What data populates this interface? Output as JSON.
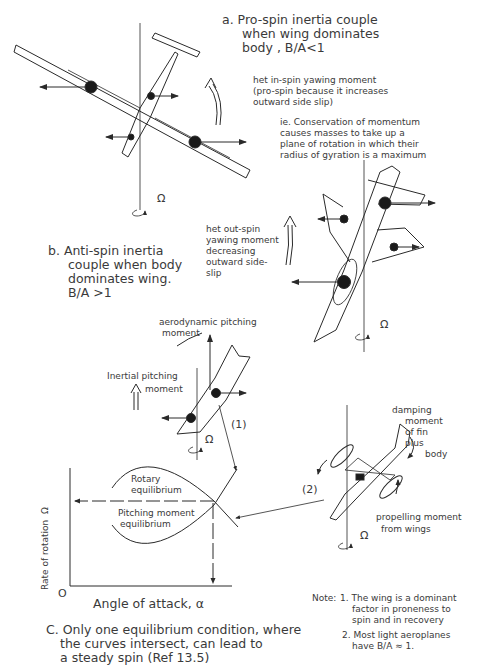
{
  "panel_a": {
    "caption_line1": "a. Pro-spin inertia couple",
    "caption_line2": "when wing dominates",
    "caption_line3": "body , B/A<1",
    "yaw_note_line1": "het in-spin yawing moment",
    "yaw_note_line2": "(pro-spin because it increases",
    "yaw_note_line3": "outward side slip)",
    "ie_note_line1": "ie. Conservation of momentum",
    "ie_note_line2": "causes masses to take up a",
    "ie_note_line3": "plane of rotation in which their",
    "ie_note_line4": "radius of gyration is a maximum",
    "omega_symbol": "Ω"
  },
  "panel_b": {
    "caption_line1": "b. Anti-spin inertia",
    "caption_line2": "couple when body",
    "caption_line3": "dominates wing.",
    "caption_line4": "B/A >1",
    "yaw_note_line1": "het out-spin",
    "yaw_note_line2": "yawing moment",
    "yaw_note_line3": "decreasing",
    "yaw_note_line4": "outward side-",
    "yaw_note_line5": "slip",
    "omega_symbol": "Ω"
  },
  "panel_c": {
    "aero_pitch_line1": "aerodynamic pitching",
    "aero_pitch_line2": "moment",
    "inertial_pitch_line1": "Inertial pitching",
    "inertial_pitch_line2": "moment",
    "marker_1": "(1)",
    "marker_2": "(2)",
    "damping_line1": "damping",
    "damping_line2": "moment",
    "damping_line3": "of fin",
    "damping_line4": "plus",
    "damping_line5": "body",
    "propelling_line1": "propelling moment",
    "propelling_line2": "from wings",
    "omega_symbol": "Ω",
    "caption_line1": "C. Only one equilibrium condition, where",
    "caption_line2": "the curves intersect, can lead to",
    "caption_line3": "a steady spin (Ref 13.5)"
  },
  "graph": {
    "ylabel": "Rate of rotation  Ω",
    "xlabel": "Angle of attack, α",
    "origin": "O",
    "curve_upper_label_line1": "Rotary",
    "curve_upper_label_line2": "equilibrium",
    "curve_lower_label_line1": "Pitching moment",
    "curve_lower_label_line2": "equilibrium"
  },
  "notes": {
    "note_prefix": "Note:",
    "note1_line1": "1. The wing is a dominant",
    "note1_line2": "factor in proneness to",
    "note1_line3": "spin and in recovery",
    "note2_line1": "2. Most light aeroplanes",
    "note2_line2": "have B/A ≈ 1."
  },
  "colors": {
    "ink": "#2a2a2a",
    "paper": "#ffffff"
  }
}
